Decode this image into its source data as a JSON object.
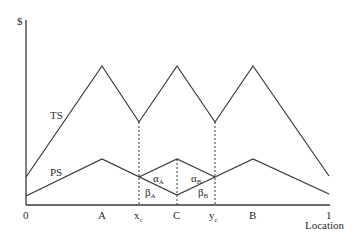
{
  "diagram": {
    "y_axis_label": "$",
    "x_axis_label": "Location",
    "curve_labels": {
      "ts": "TS",
      "ps": "PS"
    },
    "x_ticks": [
      {
        "label": "0",
        "x": 26
      },
      {
        "label": "A",
        "x": 102
      },
      {
        "label": "x",
        "sub": "c",
        "x": 139
      },
      {
        "label": "C",
        "x": 177
      },
      {
        "label": "y",
        "sub": "c",
        "x": 215
      },
      {
        "label": "B",
        "x": 253
      },
      {
        "label": "1",
        "x": 329
      }
    ],
    "region_labels": [
      {
        "greek": "α",
        "sub": "A"
      },
      {
        "greek": "β",
        "sub": "A"
      },
      {
        "greek": "α",
        "sub": "B"
      },
      {
        "greek": "β",
        "sub": "B"
      }
    ],
    "colors": {
      "line": "#3a3a3a",
      "text": "#2a2a2a",
      "background": "#ffffff"
    }
  }
}
